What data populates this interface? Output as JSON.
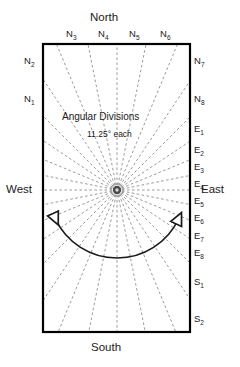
{
  "figure": {
    "title_center": "Angular Divisions",
    "subtitle_center": "11.25° each",
    "shape": "rectangle",
    "colors": {
      "border": "#000000",
      "ray": "#808080",
      "text": "#1a1a1a",
      "background": "#ffffff",
      "hub": "#3a3a3a"
    }
  },
  "cardinals": {
    "north": "North",
    "south": "South",
    "east": "East",
    "west": "West"
  },
  "sectors": {
    "top": [
      {
        "base": "N",
        "index": "3"
      },
      {
        "base": "N",
        "index": "4"
      },
      {
        "base": "N",
        "index": "5"
      },
      {
        "base": "N",
        "index": "6"
      }
    ],
    "left": [
      {
        "base": "N",
        "index": "2"
      },
      {
        "base": "N",
        "index": "1"
      }
    ],
    "right": [
      {
        "base": "N",
        "index": "7"
      },
      {
        "base": "N",
        "index": "8"
      },
      {
        "base": "E",
        "index": "1"
      },
      {
        "base": "E",
        "index": "2"
      },
      {
        "base": "E",
        "index": "3"
      },
      {
        "base": "E",
        "index": "4"
      },
      {
        "base": "E",
        "index": "5"
      },
      {
        "base": "E",
        "index": "6"
      },
      {
        "base": "E",
        "index": "7"
      },
      {
        "base": "E",
        "index": "8"
      },
      {
        "base": "S",
        "index": "1"
      },
      {
        "base": "S",
        "index": "2"
      }
    ]
  },
  "chart_data": {
    "type": "diagram",
    "title": "Angular Divisions",
    "annotation": "11.25° each",
    "divisions": 32,
    "step_degrees": 11.25,
    "center": {
      "x": 117,
      "y": 190
    },
    "bounds": {
      "left": 43,
      "top": 44,
      "right": 190,
      "bottom": 332
    },
    "ray_angles_deg": [
      0,
      11.25,
      22.5,
      33.75,
      45,
      56.25,
      67.5,
      78.75,
      90,
      101.25,
      112.5,
      123.75,
      135,
      146.25,
      157.5,
      168.75,
      180,
      191.25,
      202.5,
      213.75,
      225,
      236.25,
      247.5,
      258.75,
      270,
      281.25,
      292.5,
      303.75,
      315,
      326.25,
      337.5,
      348.75
    ],
    "arc_arrows": {
      "style": "double-headed",
      "start_deg": 205,
      "end_deg": 335,
      "radius": 68
    }
  }
}
